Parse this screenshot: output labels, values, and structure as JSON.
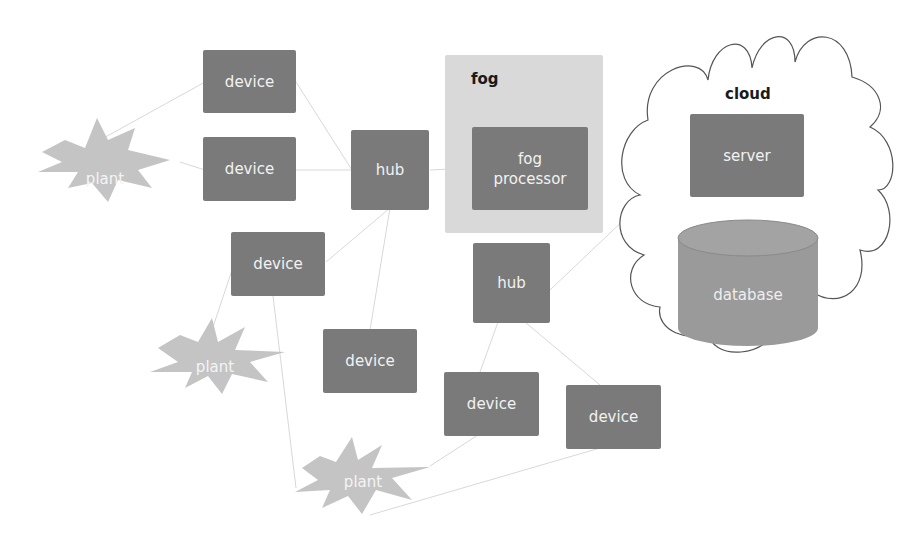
{
  "diagram": {
    "type": "fog computing architecture",
    "colors": {
      "device_fill": "#7a7a7a",
      "plant_fill": "#c4c4c4",
      "fog_panel_fill": "#d9d9d9",
      "database_fill": "#9a9a9a",
      "connector": "#d8d8d8",
      "cloud_outline": "#555555"
    },
    "regions": {
      "fog": {
        "label": "fog"
      },
      "cloud": {
        "label": "cloud"
      }
    },
    "nodes": {
      "device_1": {
        "label": "device"
      },
      "device_2": {
        "label": "device"
      },
      "device_3": {
        "label": "device"
      },
      "device_4": {
        "label": "device"
      },
      "device_5": {
        "label": "device"
      },
      "device_6": {
        "label": "device"
      },
      "hub_1": {
        "label": "hub"
      },
      "hub_2": {
        "label": "hub"
      },
      "fog_processor": {
        "label": "fog processor"
      },
      "server": {
        "label": "server"
      },
      "database": {
        "label": "database"
      },
      "plant_1": {
        "label": "plant"
      },
      "plant_2": {
        "label": "plant"
      },
      "plant_3": {
        "label": "plant"
      }
    },
    "edges": [
      [
        "plant_1",
        "device_1"
      ],
      [
        "plant_1",
        "device_2"
      ],
      [
        "device_1",
        "hub_1"
      ],
      [
        "device_2",
        "hub_1"
      ],
      [
        "device_3",
        "hub_1"
      ],
      [
        "device_4",
        "hub_1"
      ],
      [
        "hub_1",
        "fog_processor"
      ],
      [
        "device_3",
        "plant_2"
      ],
      [
        "device_3",
        "plant_3"
      ],
      [
        "hub_2",
        "device_5"
      ],
      [
        "hub_2",
        "device_6"
      ],
      [
        "hub_2",
        "server"
      ],
      [
        "device_5",
        "plant_3"
      ],
      [
        "device_6",
        "plant_3"
      ],
      [
        "server",
        "database"
      ]
    ]
  }
}
